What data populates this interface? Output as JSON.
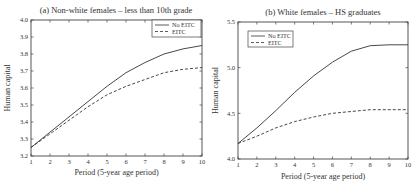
{
  "chart_data": [
    {
      "type": "line",
      "title": "(a) Non-white females – less than 10th grade",
      "xlabel": "Period (5-year age period)",
      "ylabel": "Human capital",
      "x": [
        1,
        2,
        3,
        4,
        5,
        6,
        7,
        8,
        9,
        10
      ],
      "xlim": [
        1,
        10
      ],
      "ylim": [
        3.2,
        4.0
      ],
      "xticks": [
        1,
        2,
        3,
        4,
        5,
        6,
        7,
        8,
        9,
        10
      ],
      "yticks": [
        3.2,
        3.3,
        3.4,
        3.5,
        3.6,
        3.7,
        3.8,
        3.9,
        4.0
      ],
      "ytick_labels": [
        "3.2",
        "3.3",
        "3.4",
        "3.5",
        "3.6",
        "3.7",
        "3.8",
        "3.9",
        "4.0"
      ],
      "grid": false,
      "legend_position": "upper right",
      "series": [
        {
          "name": "No EITC",
          "style": "solid",
          "values": [
            3.25,
            3.34,
            3.43,
            3.52,
            3.61,
            3.69,
            3.75,
            3.8,
            3.83,
            3.85
          ]
        },
        {
          "name": "EITC",
          "style": "dashed",
          "values": [
            3.25,
            3.33,
            3.41,
            3.49,
            3.56,
            3.61,
            3.65,
            3.69,
            3.71,
            3.72
          ]
        }
      ]
    },
    {
      "type": "line",
      "title": "(b) White females – HS graduates",
      "xlabel": "Period (5-year age period)",
      "ylabel": "Human capital",
      "x": [
        1,
        2,
        3,
        4,
        5,
        6,
        7,
        8,
        9,
        10
      ],
      "xlim": [
        1,
        10
      ],
      "ylim": [
        4.0,
        5.5
      ],
      "xticks": [
        1,
        2,
        3,
        4,
        5,
        6,
        7,
        8,
        9,
        10
      ],
      "yticks": [
        4.0,
        4.5,
        5.0,
        5.5
      ],
      "ytick_labels": [
        "4.0",
        "4.5",
        "5.0",
        "5.5"
      ],
      "grid": false,
      "legend_position": "upper left",
      "series": [
        {
          "name": "No EITC",
          "style": "solid",
          "values": [
            4.17,
            4.34,
            4.53,
            4.73,
            4.91,
            5.06,
            5.18,
            5.24,
            5.25,
            5.25
          ]
        },
        {
          "name": "EITC",
          "style": "dashed",
          "values": [
            4.17,
            4.25,
            4.34,
            4.41,
            4.46,
            4.5,
            4.52,
            4.54,
            4.54,
            4.54
          ]
        }
      ]
    }
  ]
}
